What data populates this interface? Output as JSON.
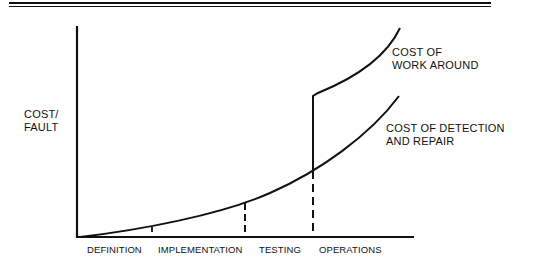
{
  "diagram": {
    "y_axis_label": [
      "COST/",
      "FAULT"
    ],
    "phases": [
      "DEFINITION",
      "IMPLEMENTATION",
      "TESTING",
      "OPERATIONS"
    ],
    "curves": [
      {
        "name": "work_around",
        "label": [
          "COST OF",
          "WORK AROUND"
        ]
      },
      {
        "name": "detection_repair",
        "label": [
          "COST OF DETECTION",
          "AND REPAIR"
        ]
      }
    ],
    "colors": {
      "ink": "#111111",
      "background": "#ffffff"
    }
  }
}
